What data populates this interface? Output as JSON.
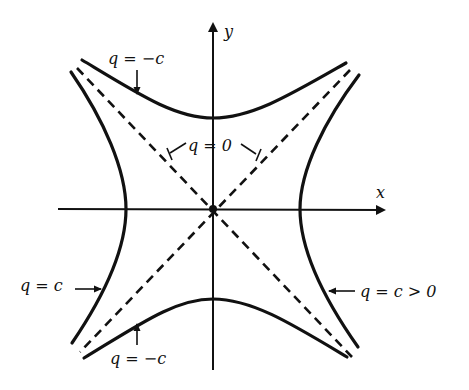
{
  "figure": {
    "type": "hyperbolas_with_asymptotes",
    "axes": {
      "x_label": "x",
      "y_label": "y"
    },
    "labels": {
      "top_curve": "q = −c",
      "asymptotes": "q = 0",
      "left_curve": "q = c",
      "right_curve": "q = c > 0",
      "bottom_curve": "q = −c"
    },
    "colors": {
      "ink": "#111111",
      "background": "#ffffff"
    }
  }
}
